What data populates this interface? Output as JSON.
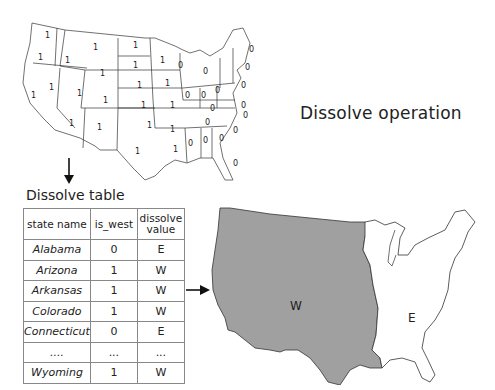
{
  "title": "Dissolve operation",
  "top_map": {
    "description": "US states map with is_west attribute values",
    "west_value": "1",
    "east_value": "0",
    "line_color": "#333333",
    "fill_color": "#ffffff"
  },
  "table": {
    "title": "Dissolve table",
    "headers": [
      "state name",
      "is_west",
      "dissolve value"
    ],
    "header_dissolve_line1": "dissolve",
    "header_dissolve_line2": "value",
    "rows": [
      [
        "Alabama",
        "0",
        "E"
      ],
      [
        "Arizona",
        "1",
        "W"
      ],
      [
        "Arkansas",
        "1",
        "W"
      ],
      [
        "Colorado",
        "1",
        "W"
      ],
      [
        "Connecticut",
        "0",
        "E"
      ],
      [
        "....",
        "...",
        "..."
      ],
      [
        "Wyoming",
        "1",
        "W"
      ]
    ]
  },
  "bottom_map": {
    "regions": [
      {
        "label": "W",
        "fill": "#a0a0a0"
      },
      {
        "label": "E",
        "fill": "#ffffff"
      }
    ]
  }
}
